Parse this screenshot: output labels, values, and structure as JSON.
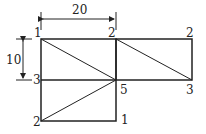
{
  "diagram": {
    "type": "finite-element mesh",
    "dimensions": {
      "horizontal": "20",
      "vertical": "10"
    },
    "node_labels": {
      "top_left": "1",
      "top_middle": "2",
      "top_right": "2",
      "middle_left": "3",
      "middle_center": "5",
      "middle_right": "3",
      "bottom_left": "2",
      "bottom_middle": "1"
    },
    "colors": {
      "line": "#222222",
      "background": "#ffffff"
    }
  }
}
